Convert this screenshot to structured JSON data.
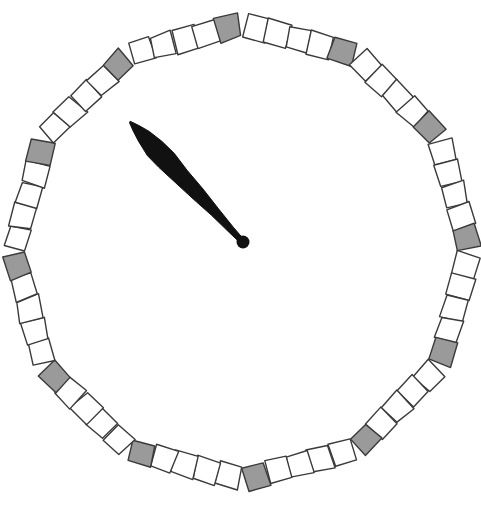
{
  "scene": {
    "name": "analog-clock-face",
    "title": "Hand-drawn polygonal clock face with single pointer",
    "width": 481,
    "height": 513,
    "background_color": "#ffffff"
  },
  "dial": {
    "shape": "dodecagon",
    "sides": 12,
    "center_x": 242,
    "center_y": 252,
    "radius": 216,
    "rotation_offset_deg": -90,
    "cells_per_side": 5,
    "total_cells": 60,
    "cell_size": 23,
    "marker_index_in_side": 4,
    "colors": {
      "cell_fill": "#ffffff",
      "marker_fill": "#9a9a9a",
      "stroke": "#3a3a3a"
    },
    "stroke_width": 1.4,
    "hour_marker_count": 12,
    "jitter_amount": 1.6
  },
  "hand": {
    "label": "clock-hand",
    "color": "#111111",
    "pivot_x": 243,
    "pivot_y": 242,
    "tip_x": 130,
    "tip_y": 122,
    "length": 165,
    "angle_deg": 226.7,
    "max_half_width": 11,
    "widest_at_fraction": 0.68,
    "pivot_radius": 6.5,
    "pointing_hour": 10,
    "reading": "10:00"
  },
  "labels": {
    "dial_name": "polygon-dial",
    "hand_name": "hour-hand",
    "pivot_name": "hand-pivot"
  }
}
